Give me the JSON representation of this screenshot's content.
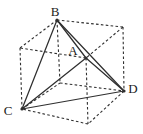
{
  "diagram": {
    "canvas": {
      "width": 143,
      "height": 134
    },
    "colors": {
      "background": "#ffffff",
      "line": "#2f2f2f",
      "label": "#1c1c1c"
    },
    "vertices": {
      "B": {
        "x": 57,
        "y": 20
      },
      "A": {
        "x": 86,
        "y": 58
      },
      "C": {
        "x": 22,
        "y": 109
      },
      "D": {
        "x": 124,
        "y": 91
      },
      "TL": {
        "x": 20,
        "y": 48
      },
      "TR": {
        "x": 123,
        "y": 27
      },
      "UB": {
        "x": 60,
        "y": 83
      },
      "UA": {
        "x": 88,
        "y": 124
      }
    },
    "solid_edges": [
      [
        "B",
        "C"
      ],
      [
        "B",
        "A"
      ],
      [
        "B",
        "D"
      ],
      [
        "C",
        "A"
      ],
      [
        "C",
        "D"
      ],
      [
        "A",
        "D"
      ]
    ],
    "dashed_edges": [
      [
        "TL",
        "B"
      ],
      [
        "B",
        "TR"
      ],
      [
        "TR",
        "A"
      ],
      [
        "A",
        "TL"
      ],
      [
        "C",
        "UB"
      ],
      [
        "UB",
        "D"
      ],
      [
        "D",
        "UA"
      ],
      [
        "UA",
        "C"
      ],
      [
        "TL",
        "C"
      ],
      [
        "B",
        "UB"
      ],
      [
        "TR",
        "D"
      ],
      [
        "A",
        "UA"
      ]
    ],
    "dot_vertices": [
      "B",
      "A",
      "C",
      "D"
    ],
    "dot_radius": 1.6,
    "labels": [
      {
        "text": "B",
        "x": 55,
        "y": 16
      },
      {
        "text": "A",
        "x": 73,
        "y": 55
      },
      {
        "text": "C",
        "x": 8,
        "y": 115
      },
      {
        "text": "D",
        "x": 133,
        "y": 93
      }
    ]
  }
}
